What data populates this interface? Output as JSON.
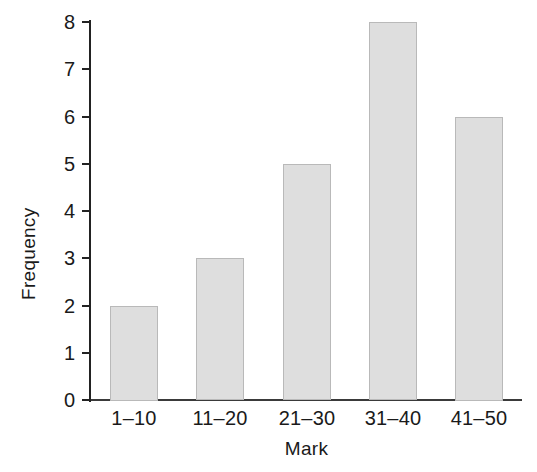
{
  "chart_data": {
    "type": "bar",
    "title": "",
    "xlabel": "Mark",
    "ylabel": "Frequency",
    "categories": [
      "1–10",
      "11–20",
      "21–30",
      "31–40",
      "41–50"
    ],
    "values": [
      2,
      3,
      5,
      8,
      6
    ],
    "ylim": [
      0,
      8
    ],
    "xlim_categories": 5,
    "y_ticks": [
      0,
      1,
      2,
      3,
      4,
      5,
      6,
      7,
      8
    ],
    "y_tick_labels": [
      "0",
      "1",
      "2",
      "3",
      "4",
      "5",
      "6",
      "7",
      "8"
    ],
    "grid": false,
    "legend": false,
    "legend_position": "none",
    "bar_fill_color": "#dedede",
    "bar_border_color": "#b9b9b9",
    "axis_color": "#222222",
    "text_color": "#1a1a1a",
    "background_color": "#ffffff"
  }
}
